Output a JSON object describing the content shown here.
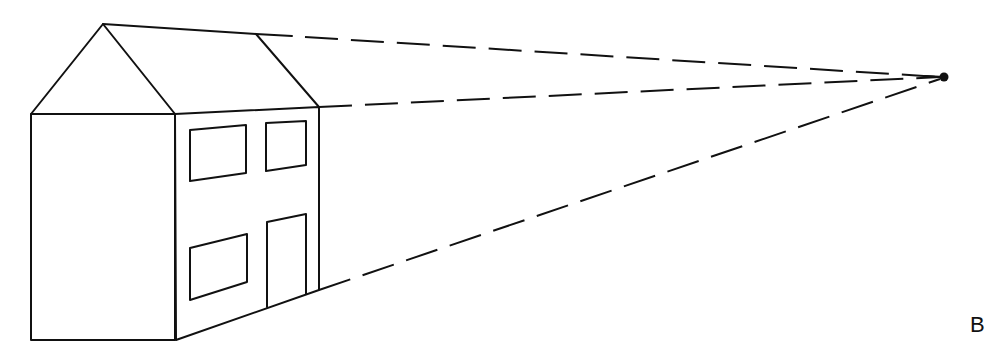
{
  "figure": {
    "label": "B",
    "ink_color": "#111111",
    "background": "#ffffff"
  },
  "house": {
    "gable_apex": [
      103,
      24
    ],
    "front_wall": {
      "top_left": [
        31,
        114
      ],
      "top_right": [
        175,
        114
      ],
      "bottom_right": [
        176,
        340
      ],
      "bottom_left": [
        31,
        340
      ]
    },
    "side_wall": {
      "top_left": [
        175,
        114
      ],
      "top_right": [
        319,
        107
      ],
      "bottom_right": [
        319,
        290
      ],
      "bottom_left": [
        176,
        340
      ]
    },
    "ridge_back": [
      256,
      34
    ],
    "upper_windows": 2,
    "lower_windows": 1,
    "doors": 1
  },
  "vanishing_point": [
    944,
    77
  ],
  "orthogonals": [
    "ridge line",
    "eave line",
    "ground line"
  ]
}
